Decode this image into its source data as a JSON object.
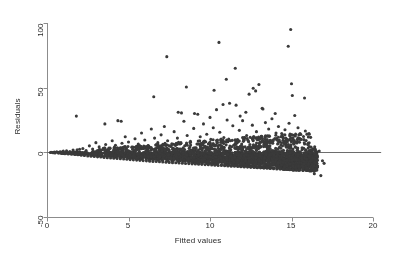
{
  "chart_data": {
    "type": "scatter",
    "title": "",
    "xlabel": "Fitted values",
    "ylabel": "Residuals",
    "xlim": [
      -0.6,
      20.6
    ],
    "ylim": [
      -58,
      108
    ],
    "xticks": [
      0,
      5,
      10,
      15,
      20
    ],
    "xticklabels": [
      "0",
      "5",
      "10",
      "15",
      "20"
    ],
    "yticks": [
      -50,
      0,
      50,
      100
    ],
    "yticklabels": [
      "-50",
      "0",
      "50",
      "100"
    ],
    "grid": false,
    "legend": null,
    "marker": {
      "shape": "circle",
      "size_px": 3.1,
      "color": "#3a3a3a"
    },
    "reference_lines": [
      {
        "orientation": "horizontal",
        "y": 0,
        "x_from": 0,
        "x_to": 20.5,
        "color": "#6e6e6e"
      }
    ],
    "points": [
      [
        0.25,
        0.1
      ],
      [
        0.35,
        -0.2
      ],
      [
        0.45,
        0.3
      ],
      [
        0.5,
        -0.4
      ],
      [
        0.6,
        0.5
      ],
      [
        0.7,
        -0.6
      ],
      [
        0.8,
        0.4
      ],
      [
        0.9,
        -0.8
      ],
      [
        1.0,
        0.9
      ],
      [
        1.1,
        -1.0
      ],
      [
        1.2,
        1.2
      ],
      [
        1.3,
        -1.3
      ],
      [
        1.4,
        0.7
      ],
      [
        1.5,
        -1.5
      ],
      [
        1.6,
        1.8
      ],
      [
        1.7,
        -1.6
      ],
      [
        1.8,
        28.0
      ],
      [
        1.85,
        2.0
      ],
      [
        1.9,
        -1.9
      ],
      [
        2.0,
        2.4
      ],
      [
        2.1,
        -2.2
      ],
      [
        2.2,
        3.0
      ],
      [
        2.3,
        -2.4
      ],
      [
        2.4,
        1.4
      ],
      [
        2.5,
        -2.8
      ],
      [
        2.6,
        5.0
      ],
      [
        2.7,
        -3.0
      ],
      [
        2.8,
        2.6
      ],
      [
        2.9,
        -3.2
      ],
      [
        3.0,
        7.5
      ],
      [
        3.05,
        1.0
      ],
      [
        3.1,
        -3.5
      ],
      [
        3.2,
        4.2
      ],
      [
        3.3,
        -3.6
      ],
      [
        3.4,
        2.0
      ],
      [
        3.5,
        -3.9
      ],
      [
        3.55,
        22.0
      ],
      [
        3.6,
        6.0
      ],
      [
        3.7,
        -4.2
      ],
      [
        3.8,
        3.4
      ],
      [
        3.9,
        -4.4
      ],
      [
        4.0,
        9.0
      ],
      [
        4.05,
        0.6
      ],
      [
        4.1,
        -4.6
      ],
      [
        4.2,
        5.5
      ],
      [
        4.3,
        -4.8
      ],
      [
        4.35,
        24.5
      ],
      [
        4.4,
        2.8
      ],
      [
        4.5,
        -5.0
      ],
      [
        4.55,
        24.0
      ],
      [
        4.6,
        7.0
      ],
      [
        4.7,
        -5.2
      ],
      [
        4.8,
        12.0
      ],
      [
        4.85,
        3.0
      ],
      [
        4.9,
        -5.4
      ],
      [
        5.0,
        8.0
      ],
      [
        5.1,
        -5.6
      ],
      [
        5.2,
        4.0
      ],
      [
        5.3,
        -5.8
      ],
      [
        5.4,
        10.5
      ],
      [
        5.45,
        1.5
      ],
      [
        5.5,
        -6.0
      ],
      [
        5.6,
        6.5
      ],
      [
        5.7,
        -6.2
      ],
      [
        5.8,
        15.0
      ],
      [
        5.85,
        3.5
      ],
      [
        5.9,
        -6.4
      ],
      [
        6.0,
        9.5
      ],
      [
        6.05,
        0.8
      ],
      [
        6.1,
        -6.6
      ],
      [
        6.2,
        5.0
      ],
      [
        6.3,
        -6.8
      ],
      [
        6.4,
        18.0
      ],
      [
        6.45,
        2.5
      ],
      [
        6.5,
        -7.0
      ],
      [
        6.55,
        43.0
      ],
      [
        6.6,
        11.0
      ],
      [
        6.7,
        -7.1
      ],
      [
        6.8,
        7.5
      ],
      [
        6.85,
        3.2
      ],
      [
        6.9,
        -7.3
      ],
      [
        7.0,
        13.5
      ],
      [
        7.05,
        1.2
      ],
      [
        7.1,
        -7.5
      ],
      [
        7.2,
        20.0
      ],
      [
        7.25,
        6.0
      ],
      [
        7.3,
        -7.6
      ],
      [
        7.35,
        74.0
      ],
      [
        7.4,
        9.0
      ],
      [
        7.5,
        -7.8
      ],
      [
        7.6,
        4.5
      ],
      [
        7.7,
        -8.0
      ],
      [
        7.8,
        16.0
      ],
      [
        7.85,
        2.0
      ],
      [
        7.9,
        -8.1
      ],
      [
        8.0,
        11.0
      ],
      [
        8.05,
        31.0
      ],
      [
        8.1,
        -8.3
      ],
      [
        8.2,
        7.0
      ],
      [
        8.25,
        30.5
      ],
      [
        8.3,
        -8.4
      ],
      [
        8.4,
        24.0
      ],
      [
        8.45,
        5.0
      ],
      [
        8.5,
        -8.6
      ],
      [
        8.55,
        50.5
      ],
      [
        8.6,
        13.0
      ],
      [
        8.7,
        -8.7
      ],
      [
        8.8,
        8.5
      ],
      [
        8.85,
        1.8
      ],
      [
        8.9,
        -8.9
      ],
      [
        9.0,
        18.5
      ],
      [
        9.05,
        30.0
      ],
      [
        9.1,
        -9.0
      ],
      [
        9.2,
        6.5
      ],
      [
        9.25,
        29.5
      ],
      [
        9.3,
        -9.2
      ],
      [
        9.4,
        12.0
      ],
      [
        9.45,
        3.0
      ],
      [
        9.5,
        -9.3
      ],
      [
        9.6,
        22.0
      ],
      [
        9.65,
        8.0
      ],
      [
        9.7,
        -9.5
      ],
      [
        9.8,
        14.0
      ],
      [
        9.85,
        4.0
      ],
      [
        9.9,
        -9.6
      ],
      [
        10.0,
        27.0
      ],
      [
        10.05,
        10.0
      ],
      [
        10.1,
        -9.8
      ],
      [
        10.2,
        19.0
      ],
      [
        10.25,
        48.0
      ],
      [
        10.3,
        -9.9
      ],
      [
        10.4,
        33.0
      ],
      [
        10.45,
        7.5
      ],
      [
        10.5,
        -10.1
      ],
      [
        10.55,
        85.0
      ],
      [
        10.6,
        15.5
      ],
      [
        10.7,
        -10.2
      ],
      [
        10.8,
        37.0
      ],
      [
        10.85,
        11.5
      ],
      [
        10.9,
        -10.4
      ],
      [
        11.0,
        56.5
      ],
      [
        11.05,
        25.0
      ],
      [
        11.1,
        -10.5
      ],
      [
        11.2,
        38.0
      ],
      [
        11.25,
        9.0
      ],
      [
        11.3,
        -10.7
      ],
      [
        11.4,
        20.5
      ],
      [
        11.45,
        5.5
      ],
      [
        11.5,
        -10.8
      ],
      [
        11.55,
        65.0
      ],
      [
        11.6,
        36.5
      ],
      [
        11.7,
        -11.0
      ],
      [
        11.8,
        17.0
      ],
      [
        11.85,
        28.0
      ],
      [
        11.9,
        -11.1
      ],
      [
        12.0,
        24.5
      ],
      [
        12.05,
        8.5
      ],
      [
        12.1,
        -11.3
      ],
      [
        12.2,
        31.0
      ],
      [
        12.25,
        13.0
      ],
      [
        12.3,
        -11.4
      ],
      [
        12.4,
        45.0
      ],
      [
        12.45,
        6.0
      ],
      [
        12.5,
        -11.6
      ],
      [
        12.6,
        21.0
      ],
      [
        12.65,
        49.5
      ],
      [
        12.7,
        -11.7
      ],
      [
        12.8,
        47.5
      ],
      [
        12.85,
        16.0
      ],
      [
        12.9,
        -11.9
      ],
      [
        13.0,
        52.5
      ],
      [
        13.05,
        10.5
      ],
      [
        13.1,
        -12.0
      ],
      [
        13.2,
        34.0
      ],
      [
        13.25,
        33.5
      ],
      [
        13.3,
        -12.2
      ],
      [
        13.4,
        23.0
      ],
      [
        13.45,
        4.5
      ],
      [
        13.5,
        -12.3
      ],
      [
        13.6,
        18.0
      ],
      [
        13.65,
        12.5
      ],
      [
        13.7,
        -12.5
      ],
      [
        13.8,
        26.0
      ],
      [
        13.85,
        7.0
      ],
      [
        13.9,
        -12.6
      ],
      [
        14.0,
        30.0
      ],
      [
        14.05,
        15.0
      ],
      [
        14.1,
        -12.8
      ],
      [
        14.2,
        20.0
      ],
      [
        14.25,
        9.5
      ],
      [
        14.3,
        -12.9
      ],
      [
        14.4,
        14.5
      ],
      [
        14.45,
        5.0
      ],
      [
        14.5,
        -13.1
      ],
      [
        14.6,
        17.5
      ],
      [
        14.65,
        11.0
      ],
      [
        14.7,
        -13.2
      ],
      [
        14.8,
        82.0
      ],
      [
        14.85,
        22.5
      ],
      [
        14.9,
        -13.4
      ],
      [
        14.95,
        95.0
      ],
      [
        15.0,
        53.0
      ],
      [
        15.05,
        44.0
      ],
      [
        15.1,
        -13.5
      ],
      [
        15.2,
        28.5
      ],
      [
        15.25,
        8.0
      ],
      [
        15.3,
        -13.7
      ],
      [
        15.4,
        19.0
      ],
      [
        15.45,
        13.5
      ],
      [
        15.5,
        -13.8
      ],
      [
        15.6,
        10.0
      ],
      [
        15.65,
        3.5
      ],
      [
        15.7,
        -14.0
      ],
      [
        15.8,
        42.0
      ],
      [
        15.85,
        16.5
      ],
      [
        15.9,
        -14.1
      ],
      [
        16.0,
        6.0
      ],
      [
        16.05,
        -9.0
      ],
      [
        16.1,
        -14.3
      ],
      [
        16.2,
        2.0
      ],
      [
        16.3,
        -12.0
      ],
      [
        16.4,
        -16.5
      ],
      [
        16.5,
        -3.0
      ],
      [
        16.6,
        -10.5
      ],
      [
        16.7,
        1.0
      ],
      [
        16.8,
        -18.0
      ],
      [
        16.9,
        -6.5
      ],
      [
        17.0,
        -8.5
      ]
    ]
  },
  "axes": {
    "xlabel": "Fitted values",
    "ylabel": "Residuals",
    "xticklabels": [
      "0",
      "5",
      "10",
      "15",
      "20"
    ],
    "yticklabels": [
      "100",
      "50",
      "0",
      "-50"
    ]
  },
  "colors": {
    "marker": "#3a3a3a",
    "axis": "#8c8c8c",
    "zero_line": "#6e6e6e",
    "background": "#ffffff",
    "text": "#2b2b2b"
  }
}
